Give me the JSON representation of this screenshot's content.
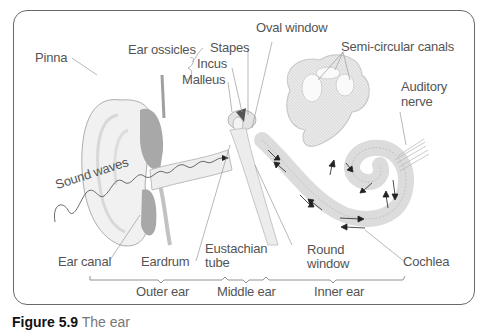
{
  "figure": {
    "number": "Figure 5.9",
    "title": "The ear"
  },
  "labels": {
    "pinna": "Pinna",
    "ear_ossicles": "Ear ossicles",
    "stapes": "Stapes",
    "incus": "Incus",
    "malleus": "Malleus",
    "oval_window": "Oval window",
    "semicircular_canals": "Semi-circular canals",
    "auditory_nerve_line1": "Auditory",
    "auditory_nerve_line2": "nerve",
    "sound_waves": "Sound waves",
    "ear_canal": "Ear canal",
    "eardrum": "Eardrum",
    "eustachian_line1": "Eustachian",
    "eustachian_line2": "tube",
    "round_window_line1": "Round",
    "round_window_line2": "window",
    "cochlea": "Cochlea"
  },
  "regions": {
    "outer_ear": "Outer ear",
    "middle_ear": "Middle ear",
    "inner_ear": "Inner ear"
  },
  "colors": {
    "frame": "#6a6a6a",
    "label_text": "#555555",
    "leader_lines": "#9a9a9a",
    "structure_fill": "#e6e6e6",
    "eardrum_fill": "#a8a8a8",
    "arrows": "#222222"
  }
}
